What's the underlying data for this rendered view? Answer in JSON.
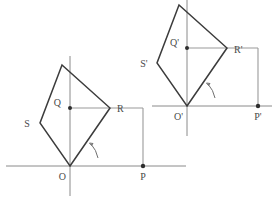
{
  "figure": {
    "stroke_colors": {
      "shape": "#3c3c3c",
      "axis": "#8a8a8a",
      "projection": "#9a9a9a",
      "arc": "#6f6f6f",
      "label": "#4a4a4a",
      "background": "#ffffff"
    },
    "original": {
      "name": "pre-image-square",
      "vertices": [
        {
          "label": "O",
          "x": 70,
          "y": 166
        },
        {
          "label": "R",
          "x": 110,
          "y": 108
        },
        {
          "label": "T",
          "x": 62,
          "y": 65
        },
        {
          "label": "S",
          "x": 40,
          "y": 123
        }
      ],
      "labels": {
        "origin": "O",
        "right_vertex": "R",
        "left_vertex": "S",
        "axis_point": "Q",
        "foot_point": "P"
      },
      "points": {
        "Q": {
          "x": 70,
          "y": 108
        },
        "P": {
          "x": 143,
          "y": 166
        }
      }
    },
    "image": {
      "name": "image-square",
      "vertices": [
        {
          "label": "O'",
          "x": 187,
          "y": 106
        },
        {
          "label": "R'",
          "x": 227,
          "y": 48
        },
        {
          "label": "T'",
          "x": 179,
          "y": 5
        },
        {
          "label": "S'",
          "x": 157,
          "y": 63
        }
      ],
      "labels": {
        "origin": "O'",
        "right_vertex": "R'",
        "left_vertex": "S'",
        "axis_point": "Q'",
        "foot_point": "P'"
      },
      "points": {
        "Q'": {
          "x": 187,
          "y": 48
        },
        "P'": {
          "x": 258,
          "y": 106
        }
      }
    }
  }
}
